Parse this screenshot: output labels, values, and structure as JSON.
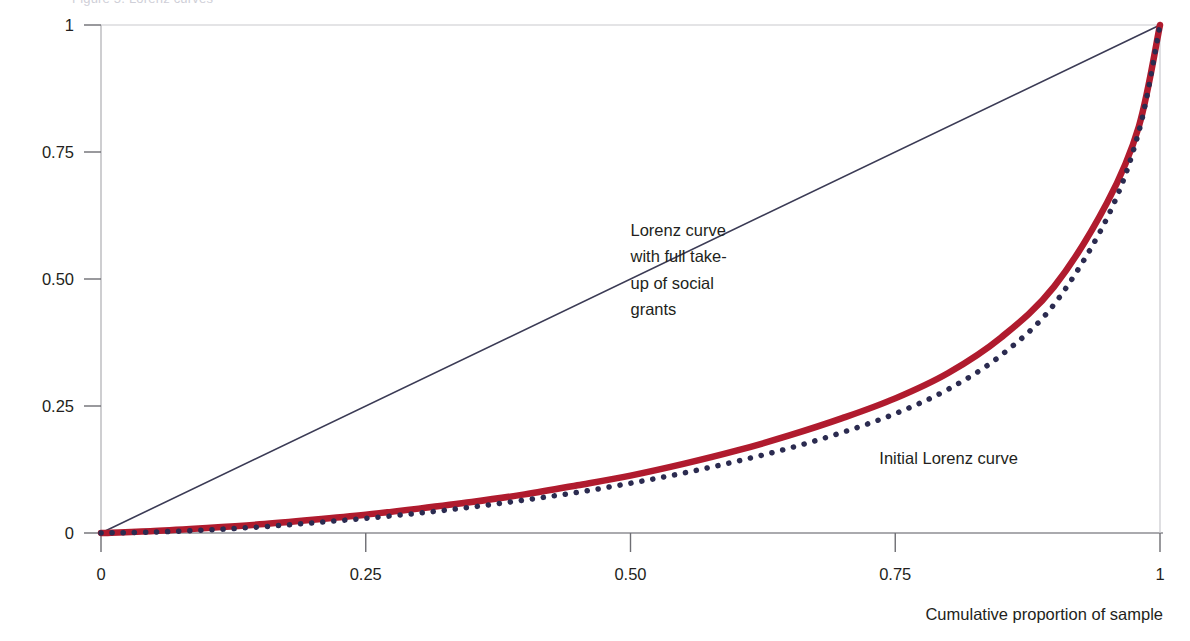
{
  "figure": {
    "clipped_header_text": "Figure 5. Lorenz curves",
    "background_color": "#ffffff"
  },
  "chart_data": {
    "type": "line",
    "title": "",
    "subtitle": "",
    "xlabel": "Cumulative proportion of sample",
    "ylabel": "",
    "xlim": [
      0,
      1
    ],
    "ylim": [
      0,
      1
    ],
    "grid": false,
    "legend_position": "inline-annotations",
    "xticks": [
      "0",
      "0.25",
      "0.50",
      "0.75",
      "1"
    ],
    "xtick_values": [
      0,
      0.25,
      0.5,
      0.75,
      1
    ],
    "yticks": [
      "0",
      "0.25",
      "0.50",
      "0.75",
      "1"
    ],
    "ytick_values": [
      0,
      0.25,
      0.5,
      0.75,
      1
    ],
    "series": [
      {
        "name": "Line of equality",
        "style": "solid-thin",
        "color": "#3b3b55",
        "x": [
          0,
          1
        ],
        "values": [
          0,
          1
        ]
      },
      {
        "name": "Lorenz curve with full take-up of social grants",
        "style": "solid-thick",
        "color": "#b01b2e",
        "x": [
          0,
          0.05,
          0.1,
          0.15,
          0.2,
          0.25,
          0.3,
          0.35,
          0.4,
          0.45,
          0.5,
          0.55,
          0.6,
          0.65,
          0.7,
          0.75,
          0.8,
          0.85,
          0.9,
          0.95,
          0.98,
          1
        ],
        "values": [
          0,
          0.004,
          0.01,
          0.017,
          0.026,
          0.036,
          0.048,
          0.061,
          0.076,
          0.094,
          0.113,
          0.136,
          0.162,
          0.192,
          0.226,
          0.265,
          0.315,
          0.385,
          0.485,
          0.65,
          0.8,
          1
        ]
      },
      {
        "name": "Initial Lorenz curve",
        "style": "dotted",
        "color": "#2b2b50",
        "x": [
          0,
          0.05,
          0.1,
          0.15,
          0.2,
          0.25,
          0.3,
          0.35,
          0.4,
          0.45,
          0.5,
          0.55,
          0.6,
          0.65,
          0.7,
          0.75,
          0.8,
          0.85,
          0.9,
          0.95,
          0.98,
          1
        ],
        "values": [
          0,
          0.002,
          0.006,
          0.012,
          0.02,
          0.029,
          0.039,
          0.051,
          0.065,
          0.08,
          0.098,
          0.118,
          0.141,
          0.167,
          0.198,
          0.235,
          0.283,
          0.35,
          0.45,
          0.62,
          0.79,
          1
        ]
      }
    ],
    "annotations": [
      {
        "id": "annotation-lorenz-full-takeup",
        "lines": [
          "Lorenz curve",
          "with full take-",
          "up of social",
          "grants"
        ],
        "x": 0.5,
        "y": 0.585
      },
      {
        "id": "annotation-initial-lorenz",
        "lines": [
          "Initial Lorenz curve"
        ],
        "x": 0.735,
        "y": 0.135
      }
    ]
  },
  "axes": {
    "x_title": "Cumulative proportion of sample",
    "y_title": ""
  }
}
